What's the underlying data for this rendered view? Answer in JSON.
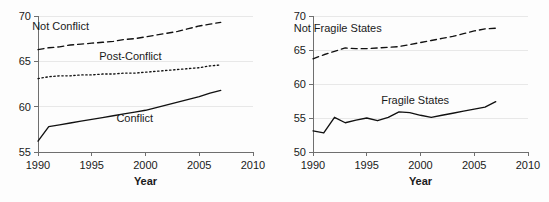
{
  "figure": {
    "panel_count": 2,
    "background_color": "#fdfdfd",
    "line_color": "#111111",
    "grid_color": "#e8e8e8",
    "axis_color": "#6f6f6f"
  },
  "chart_data": [
    {
      "type": "line",
      "panel": "left",
      "title": "",
      "xlabel": "Year",
      "ylabel": "",
      "xlim": [
        1990,
        2010
      ],
      "ylim": [
        55,
        70
      ],
      "xticks": [
        1990,
        1995,
        2000,
        2005,
        2010
      ],
      "xticklabels": [
        "1990",
        "1995",
        "2000",
        "2005",
        "2010"
      ],
      "yticks": [
        55,
        60,
        65,
        70
      ],
      "yticklabels": [
        "55",
        "60",
        "65",
        "70"
      ],
      "grid": "horizontal",
      "legend": "inline-annotations",
      "x": [
        1990,
        1991,
        1992,
        1993,
        1994,
        1995,
        1996,
        1997,
        1998,
        1999,
        2000,
        2001,
        2002,
        2003,
        2004,
        2005,
        2006,
        2007
      ],
      "series": [
        {
          "name": "Not Conflict",
          "style": "dashed",
          "label_x": 1992.1,
          "label_y": 68.5,
          "values": [
            66.3,
            66.5,
            66.6,
            66.8,
            66.9,
            67.0,
            67.1,
            67.2,
            67.4,
            67.5,
            67.7,
            67.9,
            68.1,
            68.3,
            68.6,
            68.9,
            69.1,
            69.3
          ]
        },
        {
          "name": "Post-Conflict",
          "style": "dotted",
          "label_x": 1998.6,
          "label_y": 65.2,
          "values": [
            63.1,
            63.3,
            63.4,
            63.4,
            63.5,
            63.5,
            63.6,
            63.6,
            63.7,
            63.7,
            63.8,
            63.9,
            64.0,
            64.1,
            64.2,
            64.3,
            64.5,
            64.6
          ]
        },
        {
          "name": "Conflict",
          "style": "solid",
          "label_x": 1999.0,
          "label_y": 58.3,
          "values": [
            56.2,
            57.8,
            58.0,
            58.2,
            58.4,
            58.6,
            58.8,
            59.0,
            59.2,
            59.4,
            59.6,
            59.9,
            60.2,
            60.5,
            60.8,
            61.1,
            61.5,
            61.8
          ]
        }
      ]
    },
    {
      "type": "line",
      "panel": "right",
      "title": "",
      "xlabel": "Year",
      "ylabel": "",
      "xlim": [
        1990,
        2010
      ],
      "ylim": [
        50,
        70
      ],
      "xticks": [
        1990,
        1995,
        2000,
        2005,
        2010
      ],
      "xticklabels": [
        "1990",
        "1995",
        "2000",
        "2005",
        "2010"
      ],
      "yticks": [
        50,
        55,
        60,
        65,
        70
      ],
      "yticklabels": [
        "50",
        "55",
        "60",
        "65",
        "70"
      ],
      "grid": "horizontal",
      "legend": "inline-annotations",
      "x": [
        1990,
        1991,
        1992,
        1993,
        1994,
        1995,
        1996,
        1997,
        1998,
        1999,
        2000,
        2001,
        2002,
        2003,
        2004,
        2005,
        2006,
        2007
      ],
      "series": [
        {
          "name": "Not Fragile States",
          "style": "dashed",
          "label_x": 1992.3,
          "label_y": 67.6,
          "values": [
            63.7,
            64.3,
            64.8,
            65.3,
            65.2,
            65.2,
            65.3,
            65.4,
            65.5,
            65.8,
            66.1,
            66.4,
            66.7,
            67.0,
            67.4,
            67.8,
            68.1,
            68.2
          ]
        },
        {
          "name": "Fragile States",
          "style": "solid",
          "label_x": 1999.5,
          "label_y": 57.0,
          "values": [
            53.1,
            52.8,
            55.1,
            54.3,
            54.7,
            55.0,
            54.6,
            55.1,
            55.9,
            55.8,
            55.4,
            55.1,
            55.4,
            55.7,
            56.0,
            56.3,
            56.6,
            57.4
          ]
        }
      ]
    }
  ]
}
